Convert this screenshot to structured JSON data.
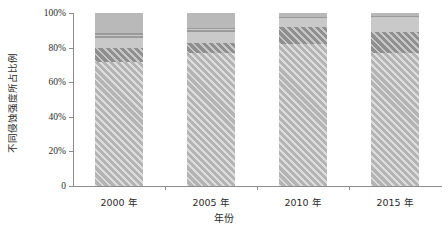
{
  "chart_data": {
    "type": "bar",
    "stacked": true,
    "title": "",
    "subtitle": "",
    "xlabel": "年份",
    "ylabel": "不同侵蚀强度所占比例",
    "categories": [
      "2000 年",
      "2005 年",
      "2010 年",
      "2015 年"
    ],
    "ytick_labels": [
      "0",
      "20%",
      "40%",
      "60%",
      "80%",
      "100%"
    ],
    "ytick_values": [
      0,
      20,
      40,
      60,
      80,
      100
    ],
    "ylim": [
      0,
      100
    ],
    "grid": false,
    "legend": "none",
    "series": [
      {
        "name": "微度",
        "pattern": "diagonal-hatch-light",
        "color": "#b4b4b4",
        "values": [
          71.5,
          77.0,
          82.0,
          77.0
        ]
      },
      {
        "name": "轻度",
        "pattern": "diagonal-hatch-dark",
        "color": "#8f8f8f",
        "values": [
          8.0,
          5.5,
          10.0,
          12.0
        ]
      },
      {
        "name": "中度",
        "pattern": "solid-light",
        "color": "#c9c9c9",
        "values": [
          5.5,
          6.0,
          4.5,
          8.0
        ]
      },
      {
        "name": "强烈",
        "pattern": "horizontal-hatch-dark",
        "color": "#9a9a9a",
        "values": [
          3.5,
          3.0,
          1.0,
          1.0
        ]
      },
      {
        "name": "极强烈",
        "pattern": "solid-mid",
        "color": "#b9b9b9",
        "values": [
          11.5,
          8.5,
          2.5,
          2.0
        ]
      }
    ]
  }
}
